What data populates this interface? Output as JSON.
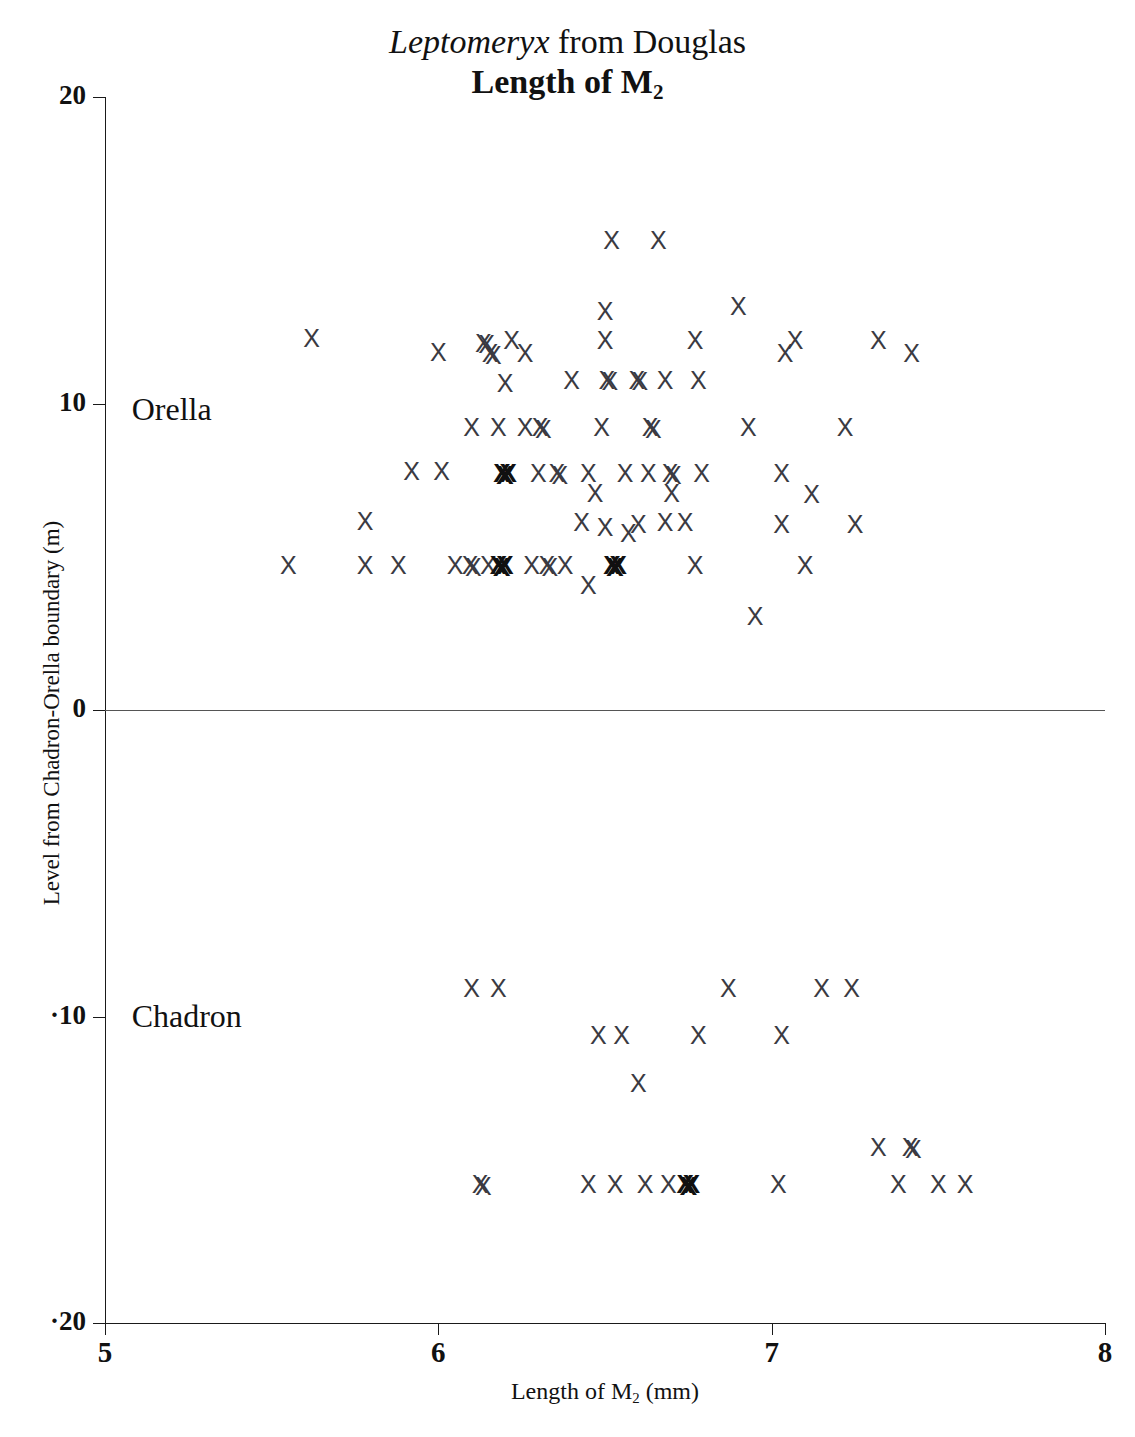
{
  "title": {
    "genus": "Leptomeryx",
    "rest": " from Douglas",
    "subtitle_prefix": "Length of M",
    "subtitle_sub": "2"
  },
  "axes": {
    "y_title": "Level from Chadron-Orella boundary (m)",
    "x_title_prefix": "Length of M",
    "x_title_sub": "2",
    "x_title_suffix": " (mm)",
    "y_ticks": [
      "20",
      "10",
      "0",
      "-10",
      "-20"
    ],
    "x_ticks": [
      "5",
      "6",
      "7",
      "8"
    ],
    "y_min": -20,
    "y_max": 20,
    "x_min": 5,
    "x_max": 8
  },
  "unit_labels": [
    {
      "name": "orella",
      "text": "Orella",
      "x": 5.08,
      "y": 9.7
    },
    {
      "name": "chadron",
      "text": "Chadron",
      "x": 5.08,
      "y": -10.1
    }
  ],
  "colors": {
    "axis": "#1a1a1a",
    "zero_line": "#555555",
    "marker": "#3a3a42",
    "marker_heavy": "#101010",
    "background": "#ffffff"
  },
  "chart_data": {
    "type": "scatter",
    "xlabel": "Length of M2 (mm)",
    "ylabel": "Level from Chadron-Orella boundary (m)",
    "xlim": [
      5,
      8
    ],
    "ylim": [
      -20,
      20
    ],
    "grid": false,
    "legend": false,
    "marker_symbol": "X",
    "reference_lines": [
      {
        "name": "chadron-orella-boundary",
        "orientation": "horizontal",
        "y": 0
      }
    ],
    "series": [
      {
        "name": "Orella",
        "points": [
          {
            "x": 6.52,
            "y": 15.3,
            "weight": 1
          },
          {
            "x": 6.66,
            "y": 15.3,
            "weight": 1
          },
          {
            "x": 6.5,
            "y": 13.0,
            "weight": 1
          },
          {
            "x": 6.9,
            "y": 13.15,
            "weight": 1
          },
          {
            "x": 5.62,
            "y": 12.1,
            "weight": 1
          },
          {
            "x": 6.14,
            "y": 11.95,
            "weight": 2
          },
          {
            "x": 6.22,
            "y": 12.05,
            "weight": 1
          },
          {
            "x": 6.5,
            "y": 12.05,
            "weight": 1
          },
          {
            "x": 6.77,
            "y": 12.05,
            "weight": 1
          },
          {
            "x": 7.07,
            "y": 12.05,
            "weight": 1
          },
          {
            "x": 7.32,
            "y": 12.05,
            "weight": 1
          },
          {
            "x": 6.0,
            "y": 11.65,
            "weight": 1
          },
          {
            "x": 6.16,
            "y": 11.6,
            "weight": 2
          },
          {
            "x": 6.26,
            "y": 11.6,
            "weight": 1
          },
          {
            "x": 7.04,
            "y": 11.6,
            "weight": 1
          },
          {
            "x": 7.42,
            "y": 11.6,
            "weight": 1
          },
          {
            "x": 6.2,
            "y": 10.65,
            "weight": 1
          },
          {
            "x": 6.4,
            "y": 10.75,
            "weight": 1
          },
          {
            "x": 6.51,
            "y": 10.75,
            "weight": 2
          },
          {
            "x": 6.6,
            "y": 10.75,
            "weight": 2
          },
          {
            "x": 6.68,
            "y": 10.75,
            "weight": 1
          },
          {
            "x": 6.78,
            "y": 10.75,
            "weight": 1
          },
          {
            "x": 6.1,
            "y": 9.2,
            "weight": 1
          },
          {
            "x": 6.18,
            "y": 9.2,
            "weight": 1
          },
          {
            "x": 6.26,
            "y": 9.2,
            "weight": 1
          },
          {
            "x": 6.31,
            "y": 9.2,
            "weight": 2
          },
          {
            "x": 6.49,
            "y": 9.2,
            "weight": 1
          },
          {
            "x": 6.64,
            "y": 9.2,
            "weight": 2
          },
          {
            "x": 6.93,
            "y": 9.2,
            "weight": 1
          },
          {
            "x": 7.22,
            "y": 9.2,
            "weight": 1
          },
          {
            "x": 5.92,
            "y": 7.75,
            "weight": 1
          },
          {
            "x": 6.01,
            "y": 7.75,
            "weight": 1
          },
          {
            "x": 6.2,
            "y": 7.7,
            "weight": 3
          },
          {
            "x": 6.3,
            "y": 7.7,
            "weight": 1
          },
          {
            "x": 6.36,
            "y": 7.7,
            "weight": 2
          },
          {
            "x": 6.45,
            "y": 7.7,
            "weight": 1
          },
          {
            "x": 6.56,
            "y": 7.7,
            "weight": 1
          },
          {
            "x": 6.63,
            "y": 7.7,
            "weight": 1
          },
          {
            "x": 6.7,
            "y": 7.7,
            "weight": 2
          },
          {
            "x": 6.79,
            "y": 7.7,
            "weight": 1
          },
          {
            "x": 7.03,
            "y": 7.7,
            "weight": 1
          },
          {
            "x": 6.47,
            "y": 7.05,
            "weight": 1
          },
          {
            "x": 6.7,
            "y": 7.05,
            "weight": 1
          },
          {
            "x": 7.12,
            "y": 7.0,
            "weight": 1
          },
          {
            "x": 5.78,
            "y": 6.15,
            "weight": 1
          },
          {
            "x": 6.43,
            "y": 6.1,
            "weight": 1
          },
          {
            "x": 6.5,
            "y": 5.95,
            "weight": 1
          },
          {
            "x": 6.57,
            "y": 5.75,
            "weight": 1
          },
          {
            "x": 6.6,
            "y": 6.05,
            "weight": 1
          },
          {
            "x": 6.68,
            "y": 6.1,
            "weight": 1
          },
          {
            "x": 6.74,
            "y": 6.1,
            "weight": 1
          },
          {
            "x": 7.03,
            "y": 6.05,
            "weight": 1
          },
          {
            "x": 7.25,
            "y": 6.05,
            "weight": 1
          },
          {
            "x": 5.55,
            "y": 4.7,
            "weight": 1
          },
          {
            "x": 5.78,
            "y": 4.7,
            "weight": 1
          },
          {
            "x": 5.88,
            "y": 4.7,
            "weight": 1
          },
          {
            "x": 6.05,
            "y": 4.7,
            "weight": 1
          },
          {
            "x": 6.1,
            "y": 4.7,
            "weight": 2
          },
          {
            "x": 6.15,
            "y": 4.7,
            "weight": 1
          },
          {
            "x": 6.19,
            "y": 4.7,
            "weight": 3
          },
          {
            "x": 6.28,
            "y": 4.7,
            "weight": 1
          },
          {
            "x": 6.33,
            "y": 4.7,
            "weight": 2
          },
          {
            "x": 6.38,
            "y": 4.7,
            "weight": 1
          },
          {
            "x": 6.53,
            "y": 4.7,
            "weight": 3
          },
          {
            "x": 6.77,
            "y": 4.7,
            "weight": 1
          },
          {
            "x": 7.1,
            "y": 4.7,
            "weight": 1
          },
          {
            "x": 6.45,
            "y": 4.05,
            "weight": 1
          },
          {
            "x": 6.95,
            "y": 3.05,
            "weight": 1
          }
        ]
      },
      {
        "name": "Chadron",
        "points": [
          {
            "x": 6.1,
            "y": -9.1,
            "weight": 1
          },
          {
            "x": 6.18,
            "y": -9.1,
            "weight": 1
          },
          {
            "x": 6.87,
            "y": -9.1,
            "weight": 1
          },
          {
            "x": 7.15,
            "y": -9.1,
            "weight": 1
          },
          {
            "x": 7.24,
            "y": -9.1,
            "weight": 1
          },
          {
            "x": 6.48,
            "y": -10.65,
            "weight": 1
          },
          {
            "x": 6.55,
            "y": -10.65,
            "weight": 1
          },
          {
            "x": 6.78,
            "y": -10.65,
            "weight": 1
          },
          {
            "x": 7.03,
            "y": -10.65,
            "weight": 1
          },
          {
            "x": 6.6,
            "y": -12.2,
            "weight": 1
          },
          {
            "x": 7.32,
            "y": -14.3,
            "weight": 1
          },
          {
            "x": 7.42,
            "y": -14.3,
            "weight": 2
          },
          {
            "x": 6.13,
            "y": -15.5,
            "weight": 2
          },
          {
            "x": 6.45,
            "y": -15.5,
            "weight": 1
          },
          {
            "x": 6.53,
            "y": -15.5,
            "weight": 1
          },
          {
            "x": 6.62,
            "y": -15.5,
            "weight": 1
          },
          {
            "x": 6.69,
            "y": -15.5,
            "weight": 1
          },
          {
            "x": 6.75,
            "y": -15.5,
            "weight": 3
          },
          {
            "x": 7.02,
            "y": -15.5,
            "weight": 1
          },
          {
            "x": 7.38,
            "y": -15.5,
            "weight": 1
          },
          {
            "x": 7.5,
            "y": -15.5,
            "weight": 1
          },
          {
            "x": 7.58,
            "y": -15.5,
            "weight": 1
          }
        ]
      }
    ]
  }
}
